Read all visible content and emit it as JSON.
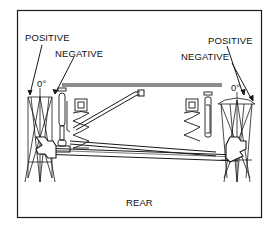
{
  "diagram": {
    "type": "rear suspension camber diagram",
    "labels": {
      "left_positive": "POSITIVE",
      "left_negative": "NEGATIVE",
      "left_zero": "0°",
      "right_positive": "POSITIVE",
      "right_negative": "NEGATIVE",
      "right_zero": "0°",
      "position": "REAR"
    },
    "colors": {
      "line": "#1a1a1a",
      "background": "#ffffff"
    }
  }
}
